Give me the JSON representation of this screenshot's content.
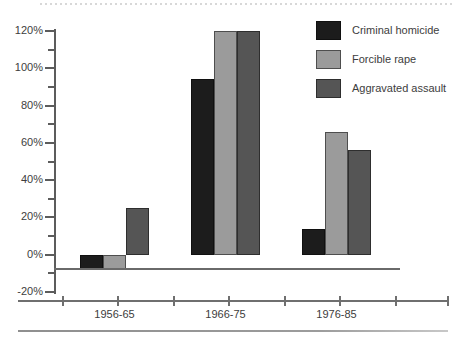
{
  "chart_data": {
    "type": "bar",
    "title": "",
    "subtitle": "",
    "xlabel": "",
    "ylabel": "",
    "categories": [
      "1956-65",
      "1966-75",
      "1976-85"
    ],
    "series": [
      {
        "name": "Criminal homicide",
        "color": "#1c1c1c",
        "values": [
          -8,
          94,
          14
        ]
      },
      {
        "name": "Forcible rape",
        "color": "#9b9b9b",
        "values": [
          -8,
          120,
          66
        ]
      },
      {
        "name": "Aggravated assault",
        "color": "#555555",
        "values": [
          25,
          120,
          56
        ]
      }
    ],
    "ylim": [
      -20,
      120
    ],
    "y_major_ticks": [
      -20,
      0,
      20,
      40,
      60,
      80,
      100,
      120
    ],
    "y_tick_labels": [
      "-20%",
      "0%",
      "20%",
      "40%",
      "60%",
      "80%",
      "100%",
      "120%"
    ],
    "y_minor_ticks": [
      -10,
      10,
      30,
      50,
      70,
      90,
      110
    ],
    "grid": false,
    "legend_position": "top-right",
    "axis_color": "#5c5c5c",
    "background": "#ffffff"
  },
  "legend": {
    "items": [
      {
        "label": "Criminal homicide"
      },
      {
        "label": "Forcible rape"
      },
      {
        "label": "Aggravated assault"
      }
    ]
  },
  "x_axis": {
    "labels": [
      "1956-65",
      "1966-75",
      "1976-85"
    ]
  },
  "y_axis": {
    "labels": [
      "120%",
      "100%",
      "80%",
      "60%",
      "40%",
      "20%",
      "0%",
      "-20%"
    ]
  }
}
